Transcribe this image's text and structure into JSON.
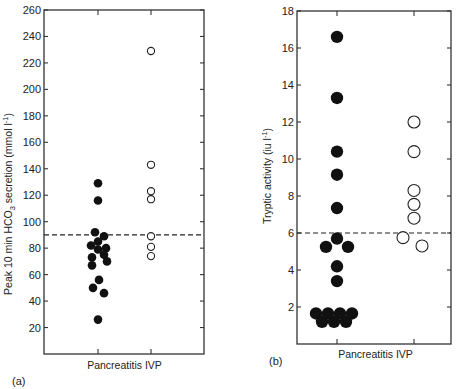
{
  "chart_data": [
    {
      "panel": "(a)",
      "type": "scatter",
      "title": "",
      "xlabel": "",
      "ylabel": "Peak 10 min HCO3 secretion (mmol l^-1)",
      "ylabel_parts": {
        "pre": "Peak 10 min HCO",
        "sub": "3",
        "post": " secretion (mmol l",
        "sup": "-1",
        "end": ")"
      },
      "categories": [
        "Pancreatitis",
        "IVP"
      ],
      "category_axis_label": "Pancreatitis IVP",
      "ylim": [
        0,
        260
      ],
      "yticks": [
        20,
        40,
        60,
        80,
        100,
        120,
        140,
        160,
        180,
        200,
        220,
        240,
        260
      ],
      "reference_line": {
        "y": 90,
        "style": "dashed"
      },
      "series": [
        {
          "name": "Pancreatitis",
          "marker": "filled-circle",
          "values": [
            129,
            116,
            92,
            89,
            85,
            82,
            80,
            79,
            75,
            73,
            70,
            67,
            56,
            50,
            46,
            26
          ],
          "x_offsets": [
            0,
            0,
            -3,
            6,
            0,
            -7,
            8,
            0,
            6,
            -6,
            9,
            -6,
            1,
            -5,
            6,
            0
          ]
        },
        {
          "name": "IVP",
          "marker": "open-circle",
          "values": [
            229,
            143,
            123,
            117,
            89,
            81,
            74
          ],
          "x_offsets": [
            0,
            0,
            0,
            0,
            0,
            0,
            0
          ]
        }
      ],
      "grid": false,
      "legend": null
    },
    {
      "panel": "(b)",
      "type": "scatter",
      "title": "",
      "xlabel": "",
      "ylabel": "Tryptic activity (iu l^-1)",
      "ylabel_parts": {
        "pre": "Tryptic activity (iu l",
        "sup": "-1",
        "end": ")"
      },
      "categories": [
        "Pancreatitis",
        "IVP"
      ],
      "category_axis_label": "Pancreatitis IVP",
      "ylim": [
        0,
        18
      ],
      "yticks": [
        2,
        4,
        6,
        8,
        10,
        12,
        14,
        16,
        18
      ],
      "reference_line": {
        "y": 6,
        "style": "dashed"
      },
      "series": [
        {
          "name": "Pancreatitis",
          "marker": "filled-circle",
          "values": [
            16.6,
            13.3,
            10.4,
            9.15,
            7.35,
            5.7,
            5.25,
            5.25,
            4.2,
            3.4,
            1.65,
            1.65,
            1.65,
            1.65,
            1.2,
            1.2,
            1.2
          ],
          "x_offsets": [
            0,
            0,
            0,
            0,
            0,
            0,
            -11,
            11,
            0,
            0,
            -21,
            -9,
            3,
            15,
            -15,
            -3,
            9
          ]
        },
        {
          "name": "IVP",
          "marker": "open-circle",
          "values": [
            12.0,
            10.4,
            8.3,
            7.55,
            6.8,
            5.75,
            5.3
          ],
          "x_offsets": [
            0,
            0,
            0,
            0,
            0,
            -11,
            8
          ]
        }
      ],
      "grid": false,
      "legend": null
    }
  ],
  "panels": {
    "a": {
      "label": "(a)"
    },
    "b": {
      "label": "(b)"
    }
  }
}
